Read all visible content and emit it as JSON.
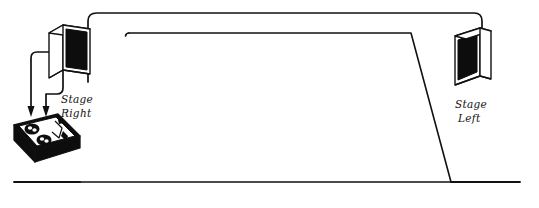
{
  "diagram": {
    "background_color": "#ffffff",
    "ink_color": "#111111",
    "speaker_fill_color": "#0d0d0d",
    "labels": {
      "stage_right_line1": "Stage",
      "stage_right_line2": "Right",
      "stage_left_line1": "Stage",
      "stage_left_line2": "Left"
    },
    "elements": {
      "left_speaker_name": "Stage Right speaker cabinet",
      "right_speaker_name": "Stage Left speaker cabinet",
      "mixer_name": "Mixer / amplifier unit",
      "mixer_knob_count": "2",
      "cable_count": "2",
      "arrow_count": "2",
      "stage_shape": "trapezoid"
    }
  }
}
